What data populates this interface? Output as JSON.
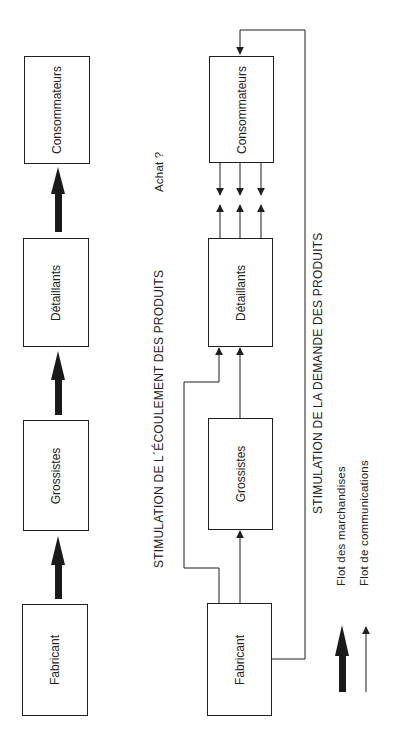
{
  "left_diagram": {
    "boxes": [
      {
        "id": "consommateurs",
        "label": "Consommateurs"
      },
      {
        "id": "detaillants",
        "label": "Détaillants"
      },
      {
        "id": "grossistes",
        "label": "Grossistes"
      },
      {
        "id": "fabricant",
        "label": "Fabricant"
      }
    ]
  },
  "right_diagram": {
    "boxes": [
      {
        "id": "consommateurs",
        "label": "Consommateurs"
      },
      {
        "id": "detaillants",
        "label": "Détaillants"
      },
      {
        "id": "grossistes",
        "label": "Grossistes"
      },
      {
        "id": "fabricant",
        "label": "Fabricant"
      }
    ],
    "annotations": {
      "achat": "Achat ?",
      "push": "STIMULATION DE L´ÉCOULEMENT DES PRODUITS",
      "pull": "STIMULATION DE LA DEMANDE DES PRODUITS"
    }
  },
  "legend": {
    "items": [
      {
        "label": "Flot des marchandises",
        "style": "thick-arrow"
      },
      {
        "label": "Flot de communications",
        "style": "thin-arrow"
      }
    ]
  },
  "colors": {
    "line": "#1f1f1f",
    "background": "#ffffff"
  }
}
